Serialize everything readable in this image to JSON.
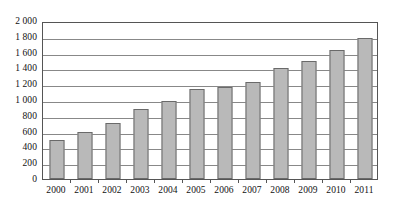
{
  "chart_data": {
    "type": "bar",
    "title": "",
    "subtitle": "",
    "xlabel": "",
    "ylabel": "",
    "categories": [
      "2000",
      "2001",
      "2002",
      "2003",
      "2004",
      "2005",
      "2006",
      "2007",
      "2008",
      "2009",
      "2010",
      "2011"
    ],
    "values": [
      490,
      600,
      710,
      890,
      985,
      1140,
      1170,
      1230,
      1400,
      1490,
      1630,
      1780
    ],
    "series": [
      {
        "name": "",
        "values": [
          490,
          600,
          710,
          890,
          985,
          1140,
          1170,
          1230,
          1400,
          1490,
          1630,
          1780
        ]
      }
    ],
    "ylim": [
      0,
      2000
    ],
    "ytick_values": [
      0,
      200,
      400,
      600,
      800,
      1000,
      1200,
      1400,
      1600,
      1800,
      2000
    ],
    "ytick_labels": [
      "0",
      "200",
      "400",
      "600",
      "800",
      "1 000",
      "1 200",
      "1 400",
      "1 600",
      "1 800",
      "2 000"
    ],
    "xtick_labels": [
      "2000",
      "2001",
      "2002",
      "2003",
      "2004",
      "2005",
      "2006",
      "2007",
      "2008",
      "2009",
      "2010",
      "2011"
    ],
    "grid": true,
    "grid_axis": "y",
    "legend": false,
    "legend_position": "none",
    "annotations": [],
    "colors": {
      "bar_fill": "#b9b9b9",
      "bar_border": "#6a6a6a",
      "gridline": "#888888",
      "axis_line": "#555555",
      "text": "#111111",
      "background": "#ffffff"
    }
  }
}
